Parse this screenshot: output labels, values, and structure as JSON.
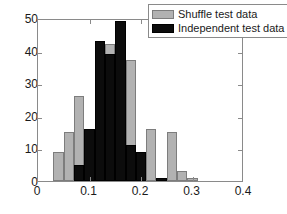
{
  "chart_data": {
    "type": "bar",
    "title": "",
    "xlabel": "",
    "ylabel": "",
    "xlim": [
      0,
      0.4
    ],
    "ylim": [
      0,
      50
    ],
    "xticks": [
      "0",
      "0.1",
      "0.2",
      "0.3",
      "0.4"
    ],
    "xtick_values": [
      0,
      0.1,
      0.2,
      0.3,
      0.4
    ],
    "yticks": [
      "0",
      "10",
      "20",
      "30",
      "40",
      "50"
    ],
    "ytick_values": [
      0,
      10,
      20,
      30,
      40,
      50
    ],
    "grid": false,
    "legend_position": "top-right",
    "bin_width": 0.02,
    "bin_starts": [
      0.03,
      0.05,
      0.07,
      0.09,
      0.11,
      0.13,
      0.15,
      0.17,
      0.19,
      0.21,
      0.23,
      0.25,
      0.27,
      0.29,
      0.31,
      0.33,
      0.35
    ],
    "series": [
      {
        "name": "Shuffle test data",
        "color": "#b2b2b2",
        "edge_color": "#7d7d7d",
        "values": [
          9,
          15,
          26,
          0,
          39,
          42,
          27,
          37,
          0,
          16,
          0,
          15,
          3,
          1,
          0,
          0,
          0
        ]
      },
      {
        "name": "Independent test data",
        "color": "#0c0c0c",
        "edge_color": "#000000",
        "values": [
          0,
          0,
          5,
          16,
          43,
          39,
          49,
          11,
          9,
          0,
          1,
          0,
          0,
          0,
          0,
          0,
          0
        ]
      }
    ]
  },
  "legend": {
    "items": [
      {
        "label": "Shuffle test data",
        "swatch": "shuffle"
      },
      {
        "label": "Independent test data",
        "swatch": "independent"
      }
    ]
  }
}
